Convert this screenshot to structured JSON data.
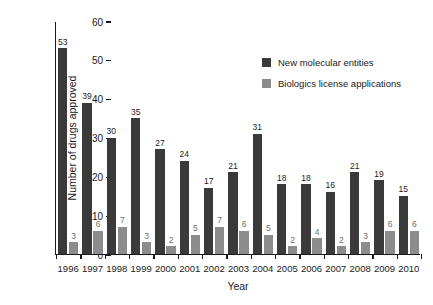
{
  "chart_data": {
    "type": "bar",
    "title": "",
    "xlabel": "Year",
    "ylabel": "Number of drugs approved",
    "categories": [
      "1996",
      "1997",
      "1998",
      "1999",
      "2000",
      "2001",
      "2002",
      "2003",
      "2004",
      "2005",
      "2006",
      "2007",
      "2008",
      "2009",
      "2010"
    ],
    "series": [
      {
        "name": "New molecular entities",
        "color": "#3a3a3a",
        "values": [
          53,
          39,
          30,
          35,
          27,
          24,
          17,
          21,
          31,
          18,
          18,
          16,
          21,
          19,
          15
        ]
      },
      {
        "name": "Biologics license applications",
        "color": "#8c8c8c",
        "values": [
          3,
          6,
          7,
          3,
          2,
          5,
          7,
          6,
          5,
          2,
          4,
          2,
          3,
          6,
          6
        ]
      }
    ],
    "ylim": [
      0,
      60
    ],
    "yticks": [
      0,
      10,
      20,
      30,
      40,
      50,
      60
    ],
    "grid": false,
    "legend_position": "upper-right-inside"
  }
}
